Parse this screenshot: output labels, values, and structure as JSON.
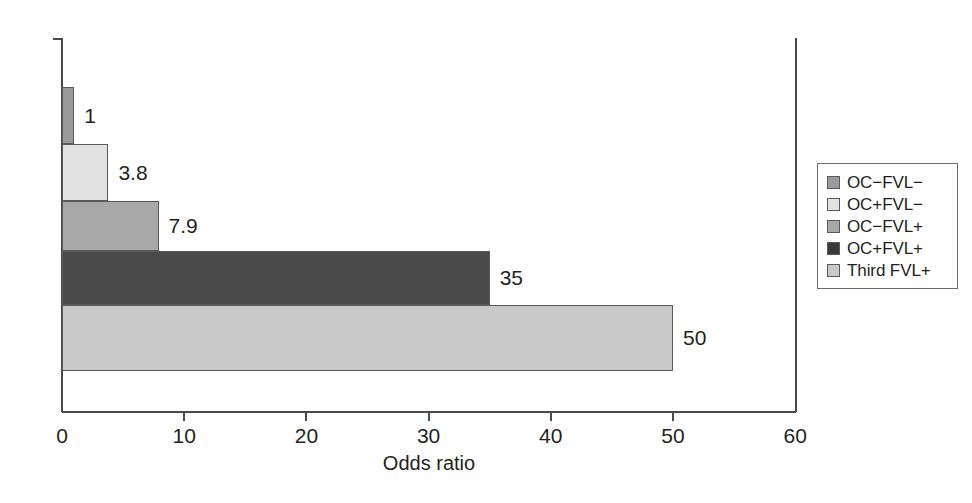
{
  "chart_data": {
    "type": "bar",
    "orientation": "horizontal",
    "title": "",
    "xlabel": "Odds ratio",
    "ylabel": "",
    "xlim": [
      0,
      60
    ],
    "ylim": [
      0,
      5
    ],
    "grid": false,
    "legend_position": "right",
    "categories": [
      "OC−FVL−",
      "OC+FVL−",
      "OC−FVL+",
      "OC+FVL+",
      "Third FVL+"
    ],
    "values": [
      1,
      3.8,
      7.9,
      35,
      50
    ],
    "value_labels": [
      "1",
      "3.8",
      "7.9",
      "35",
      "50"
    ],
    "colors": [
      "#9a9a9a",
      "#e2e2e2",
      "#a8a8a8",
      "#4a4a4a",
      "#c9c9c9"
    ],
    "xticks": [
      0,
      10,
      20,
      30,
      40,
      50,
      60
    ],
    "xtick_labels": [
      "0",
      "10",
      "20",
      "30",
      "40",
      "50",
      "60"
    ]
  },
  "axis": {
    "x_title": "Odds ratio",
    "ticks": [
      {
        "label": "0",
        "value": 0
      },
      {
        "label": "10",
        "value": 10
      },
      {
        "label": "20",
        "value": 20
      },
      {
        "label": "30",
        "value": 30
      },
      {
        "label": "40",
        "value": 40
      },
      {
        "label": "50",
        "value": 50
      },
      {
        "label": "60",
        "value": 60
      }
    ]
  },
  "bars": [
    {
      "label": "OC−FVL−",
      "value": 1,
      "value_label": "1",
      "color": "#9a9a9a"
    },
    {
      "label": "OC+FVL−",
      "value": 3.8,
      "value_label": "3.8",
      "color": "#e2e2e2"
    },
    {
      "label": "OC−FVL+",
      "value": 7.9,
      "value_label": "7.9",
      "color": "#a8a8a8"
    },
    {
      "label": "OC+FVL+",
      "value": 35,
      "value_label": "35",
      "color": "#4a4a4a"
    },
    {
      "label": "Third FVL+",
      "value": 50,
      "value_label": "50",
      "color": "#c9c9c9"
    }
  ],
  "legend": {
    "items": [
      {
        "label": "OC−FVL−",
        "color": "#9a9a9a"
      },
      {
        "label": "OC+FVL−",
        "color": "#e2e2e2"
      },
      {
        "label": "OC−FVL+",
        "color": "#a8a8a8"
      },
      {
        "label": "OC+FVL+",
        "color": "#3a3a3a"
      },
      {
        "label": "Third FVL+",
        "color": "#c9c9c9"
      }
    ]
  }
}
